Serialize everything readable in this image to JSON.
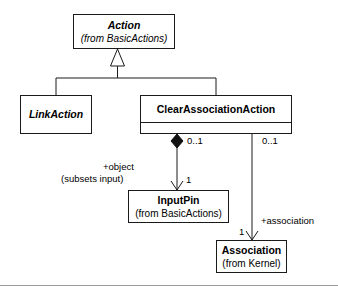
{
  "diagram": {
    "line_color": "#1a1a1a",
    "rule_color": "#9a9a9a",
    "background": "#ffffff",
    "classes": {
      "action": {
        "name": "Action",
        "package": "(from BasicActions)",
        "abstract": true
      },
      "link_action": {
        "name": "LinkAction",
        "package": "",
        "abstract": true
      },
      "clear_association_action": {
        "name": "ClearAssociationAction",
        "package": "",
        "abstract": false
      },
      "input_pin": {
        "name": "InputPin",
        "package": "(from BasicActions)",
        "abstract": false
      },
      "association": {
        "name": "Association",
        "package": "(from Kernel)",
        "abstract": false
      }
    },
    "relationships": {
      "generalization_link_action": {
        "kind": "generalization",
        "from": "LinkAction",
        "to": "Action"
      },
      "generalization_clear_association_action": {
        "kind": "generalization",
        "from": "ClearAssociationAction",
        "to": "Action"
      },
      "object_composition": {
        "kind": "composition",
        "from": "ClearAssociationAction",
        "to": "InputPin",
        "source_multiplicity": "0..1",
        "target_multiplicity": "1",
        "role_name": "+object",
        "constraint": "(subsets input)"
      },
      "association_reference": {
        "kind": "directed-association",
        "from": "ClearAssociationAction",
        "to": "Association",
        "source_multiplicity": "0..1",
        "target_multiplicity": "1",
        "role_name": "+association"
      }
    }
  }
}
